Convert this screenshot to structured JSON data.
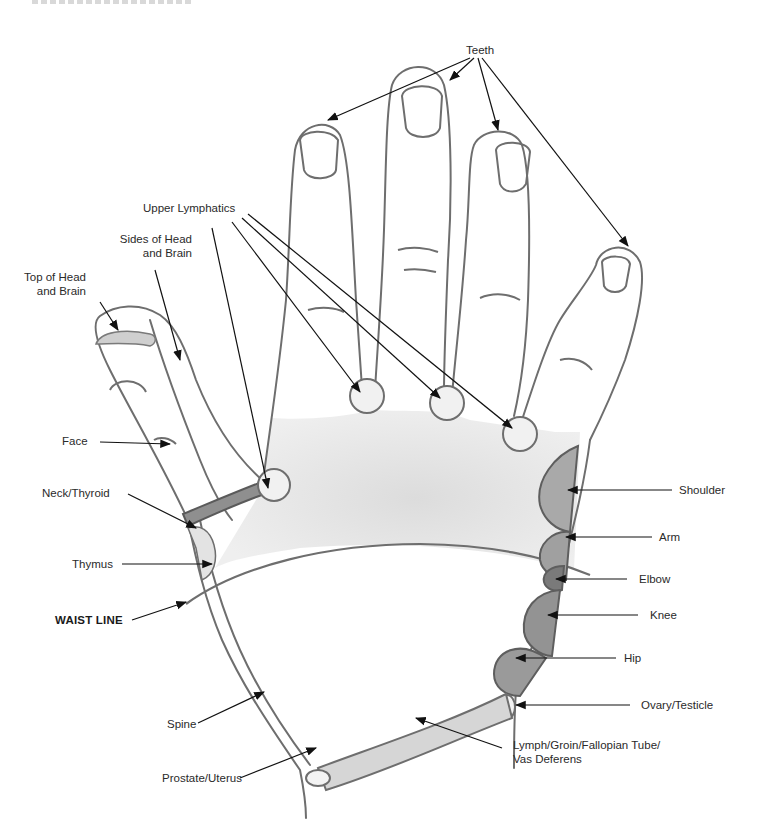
{
  "diagram": {
    "type": "hand reflexology map (back of right hand)",
    "colors": {
      "outline": "#6e6e6e",
      "shade_dark": "#8f8f8f",
      "shade_mid": "#a9a9a9",
      "shade_light": "#e6e6e6",
      "arrow": "#111111",
      "text": "#2a2a2a"
    },
    "labels": {
      "teeth": "Teeth",
      "upper_lymphatics": "Upper Lymphatics",
      "sides_of_head_line1": "Sides of Head",
      "sides_of_head_line2": "and Brain",
      "top_of_head_line1": "Top of Head",
      "top_of_head_line2": "and Brain",
      "face": "Face",
      "neck_thyroid": "Neck/Thyroid",
      "thymus": "Thymus",
      "waist_line": "WAIST LINE",
      "spine": "Spine",
      "prostate_uterus": "Prostate/Uterus",
      "shoulder": "Shoulder",
      "arm": "Arm",
      "elbow": "Elbow",
      "knee": "Knee",
      "hip": "Hip",
      "ovary_testicle": "Ovary/Testicle",
      "lymph_line1": "Lymph/Groin/Fallopian Tube/",
      "lymph_line2": "Vas Deferens"
    }
  }
}
